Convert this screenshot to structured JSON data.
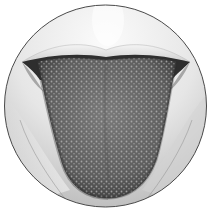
{
  "image": {
    "subject": "tongue-illustration",
    "style": "grayscale pencil drawing",
    "frame_shape": "circle"
  },
  "colors": {
    "background": "#ffffff",
    "frame_stroke": "#4a4a4a",
    "skin_light": "#f2f2f2",
    "skin_mid": "#d6d6d6",
    "skin_shadow": "#a9a9a9",
    "tongue_base": "#6e6e6e",
    "tongue_dark": "#3f3f3f",
    "papillae": "#b5b5b5",
    "mouth_shadow": "#2e2e2e"
  }
}
